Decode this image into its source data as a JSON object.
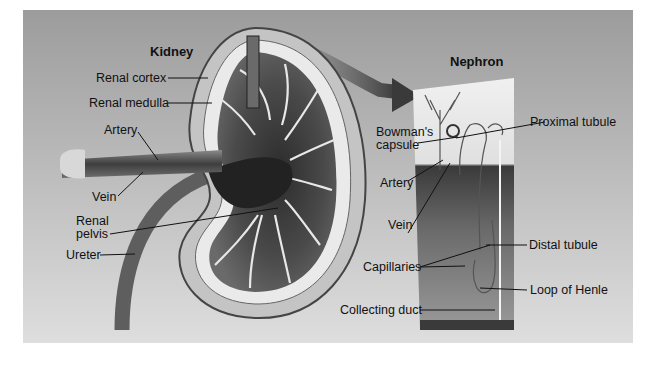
{
  "figure": {
    "kidney": {
      "title": "Kidney",
      "labels": {
        "renal_cortex": "Renal cortex",
        "renal_medulla": "Renal medulla",
        "artery": "Artery",
        "vein": "Vein",
        "renal_pelvis_1": "Renal",
        "renal_pelvis_2": "pelvis",
        "ureter": "Ureter"
      }
    },
    "nephron": {
      "title": "Nephron",
      "labels": {
        "bowmans_1": "Bowman's",
        "bowmans_2": "capsule",
        "proximal_tubule": "Proximal tubule",
        "artery": "Artery",
        "vein": "Vein",
        "distal_tubule": "Distal tubule",
        "capillaries": "Capillaries",
        "loop_of_henle": "Loop of Henle",
        "collecting_duct": "Collecting duct"
      }
    },
    "colors": {
      "background_top": "#9c9c9c",
      "background_bottom": "#dedede",
      "label_text": "#111111",
      "leader_line": "#111111"
    }
  }
}
